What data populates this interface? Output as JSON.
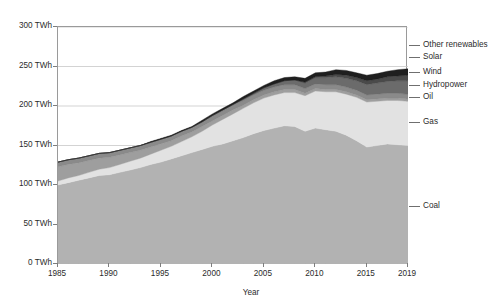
{
  "chart_data": {
    "type": "area",
    "stacked": true,
    "title": "",
    "xlabel": "Year",
    "ylabel": "",
    "grid": true,
    "legend_position": "right-outside",
    "xlim": [
      1985,
      2019
    ],
    "ylim": [
      0,
      300
    ],
    "y_unit": "TWh",
    "y_ticks": [
      0,
      50,
      100,
      150,
      200,
      250,
      300
    ],
    "y_tick_labels": [
      "0 TWh",
      "50 TWh",
      "100 TWh",
      "150 TWh",
      "200 TWh",
      "250 TWh",
      "300 TWh"
    ],
    "x_ticks": [
      1985,
      1990,
      1995,
      2000,
      2005,
      2010,
      2015,
      2019
    ],
    "x_tick_labels": [
      "1985",
      "1990",
      "1995",
      "2000",
      "2005",
      "2010",
      "2015",
      "2019"
    ],
    "x": [
      1985,
      1986,
      1987,
      1988,
      1989,
      1990,
      1991,
      1992,
      1993,
      1994,
      1995,
      1996,
      1997,
      1998,
      1999,
      2000,
      2001,
      2002,
      2003,
      2004,
      2005,
      2006,
      2007,
      2008,
      2009,
      2010,
      2011,
      2012,
      2013,
      2014,
      2015,
      2016,
      2017,
      2018,
      2019
    ],
    "series": [
      {
        "name": "Coal",
        "color": "#b2b2b2",
        "values": [
          100,
          103,
          106,
          109,
          112,
          113,
          116,
          119,
          122,
          126,
          129,
          133,
          137,
          141,
          145,
          149,
          152,
          156,
          160,
          165,
          169,
          172,
          175,
          174,
          168,
          172,
          170,
          168,
          163,
          156,
          148,
          150,
          152,
          151,
          150
        ]
      },
      {
        "name": "Gas",
        "color": "#e2e2e2",
        "values": [
          5,
          6,
          6,
          7,
          8,
          9,
          10,
          11,
          12,
          13,
          15,
          16,
          18,
          20,
          23,
          27,
          31,
          34,
          37,
          39,
          41,
          42,
          42,
          43,
          45,
          47,
          48,
          50,
          52,
          55,
          57,
          56,
          55,
          56,
          56
        ]
      },
      {
        "name": "Oil",
        "color": "#9e9e9e",
        "values": [
          18,
          17,
          16,
          15,
          14,
          13,
          12,
          11,
          10,
          9,
          8,
          7,
          7,
          6,
          6,
          5,
          5,
          5,
          4,
          4,
          4,
          4,
          4,
          4,
          3,
          3,
          3,
          3,
          3,
          3,
          3,
          3,
          3,
          3,
          3
        ]
      },
      {
        "name": "Hydropower",
        "color": "#8a8a8a",
        "values": [
          6,
          6,
          6,
          6,
          6,
          6,
          6,
          6,
          6,
          6,
          6,
          6,
          6,
          6,
          6,
          6,
          6,
          6,
          6,
          6,
          6,
          6,
          6,
          6,
          6,
          6,
          6,
          6,
          6,
          6,
          6,
          6,
          6,
          6,
          6
        ]
      },
      {
        "name": "Wind",
        "color": "#6b6b6b",
        "values": [
          0,
          0,
          0,
          0,
          0,
          0,
          0,
          0,
          0,
          0,
          0,
          0,
          0,
          0,
          0,
          1,
          1,
          1,
          2,
          2,
          3,
          4,
          5,
          6,
          7,
          8,
          9,
          10,
          11,
          12,
          13,
          14,
          15,
          16,
          17
        ]
      },
      {
        "name": "Solar",
        "color": "#4a4a4a",
        "values": [
          0,
          0,
          0,
          0,
          0,
          0,
          0,
          0,
          0,
          0,
          0,
          0,
          0,
          0,
          0,
          0,
          0,
          0,
          0,
          0,
          0,
          0,
          0,
          0,
          1,
          1,
          2,
          3,
          4,
          4,
          5,
          5,
          6,
          6,
          7
        ]
      },
      {
        "name": "Other renewables",
        "color": "#1f1f1f",
        "values": [
          0,
          0,
          0,
          0,
          0,
          0,
          0,
          0,
          0,
          1,
          1,
          1,
          1,
          1,
          2,
          2,
          2,
          2,
          3,
          3,
          3,
          4,
          4,
          4,
          5,
          5,
          5,
          6,
          6,
          6,
          7,
          7,
          7,
          8,
          8
        ]
      }
    ],
    "legend_entries": [
      {
        "label": "Other renewables",
        "y": 45
      },
      {
        "label": "Solar",
        "y": 57
      },
      {
        "label": "Wind",
        "y": 72
      },
      {
        "label": "Hydropower",
        "y": 85
      },
      {
        "label": "Oil",
        "y": 97
      },
      {
        "label": "Gas",
        "y": 122
      },
      {
        "label": "Coal",
        "y": 206
      }
    ]
  },
  "style": {
    "axis_color": "#9a9a9a",
    "grid_color": "#c8c8c8",
    "text_color": "#2b2b2b",
    "background": "#ffffff"
  }
}
